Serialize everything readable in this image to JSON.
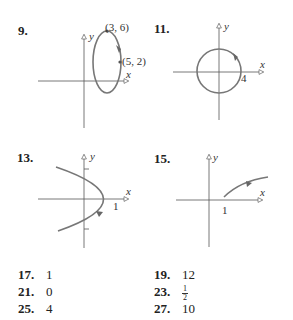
{
  "graphs": [
    {
      "number": "9.",
      "axis_x": "x",
      "axis_y": "y",
      "labels": [
        "(3, 6)",
        "(5, 2)"
      ],
      "curve": "ellipse, clockwise"
    },
    {
      "number": "11.",
      "axis_x": "x",
      "axis_y": "y",
      "labels": [
        "4"
      ],
      "curve": "circle radius 4, clockwise"
    },
    {
      "number": "13.",
      "axis_x": "x",
      "axis_y": "y",
      "labels": [
        "1"
      ],
      "curve": "leftward parabola, vertex (1,0)"
    },
    {
      "number": "15.",
      "axis_x": "x",
      "axis_y": "y",
      "labels": [
        "1"
      ],
      "curve": "square-root curve from (1,0)"
    }
  ],
  "answers": [
    {
      "number": "17.",
      "value": "1"
    },
    {
      "number": "19.",
      "value": "12"
    },
    {
      "number": "21.",
      "value": "0"
    },
    {
      "number": "23.",
      "value_num": "1",
      "value_den": "2"
    },
    {
      "number": "25.",
      "value": "4"
    },
    {
      "number": "27.",
      "value": "10"
    }
  ],
  "colors": {
    "curve": "#777777",
    "axis": "#555555"
  }
}
